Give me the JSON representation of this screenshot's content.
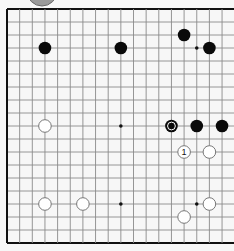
{
  "diagram": {
    "type": "go-board",
    "board_size": 19,
    "visible_columns": [
      0,
      17
    ],
    "visible_rows": [
      0,
      18
    ],
    "geometry": {
      "origin_x": 7,
      "origin_y": 9,
      "col_step": 12.65,
      "row_step": 13.0,
      "stone_radius": 6.3
    },
    "colors": {
      "background": "#f7f7f7",
      "line": "#8a8a8a",
      "edge": "#111111",
      "black_stone": "#0a0a0a",
      "white_stone": "#ffffff",
      "white_stone_outline": "#777777",
      "top_indicator": "#9a9a9a"
    },
    "top_indicator": {
      "cx": 42,
      "cy": -9,
      "r": 15
    },
    "star_points": [
      {
        "c": 3,
        "r": 3
      },
      {
        "c": 9,
        "r": 3
      },
      {
        "c": 15,
        "r": 3
      },
      {
        "c": 3,
        "r": 9
      },
      {
        "c": 9,
        "r": 9
      },
      {
        "c": 15,
        "r": 9
      },
      {
        "c": 3,
        "r": 15
      },
      {
        "c": 9,
        "r": 15
      },
      {
        "c": 15,
        "r": 15
      }
    ],
    "stones": [
      {
        "color": "black",
        "c": 3,
        "r": 3
      },
      {
        "color": "black",
        "c": 9,
        "r": 3
      },
      {
        "color": "black",
        "c": 14,
        "r": 2
      },
      {
        "color": "black",
        "c": 16,
        "r": 3
      },
      {
        "color": "white",
        "c": 3,
        "r": 9
      },
      {
        "color": "black",
        "c": 13,
        "r": 9,
        "marker": "circle"
      },
      {
        "color": "black",
        "c": 15,
        "r": 9
      },
      {
        "color": "black",
        "c": 17,
        "r": 9
      },
      {
        "color": "white",
        "c": 14,
        "r": 11,
        "label": "1"
      },
      {
        "color": "white",
        "c": 16,
        "r": 11
      },
      {
        "color": "white",
        "c": 3,
        "r": 15
      },
      {
        "color": "white",
        "c": 6,
        "r": 15
      },
      {
        "color": "white",
        "c": 16,
        "r": 15
      },
      {
        "color": "white",
        "c": 14,
        "r": 16
      }
    ]
  }
}
